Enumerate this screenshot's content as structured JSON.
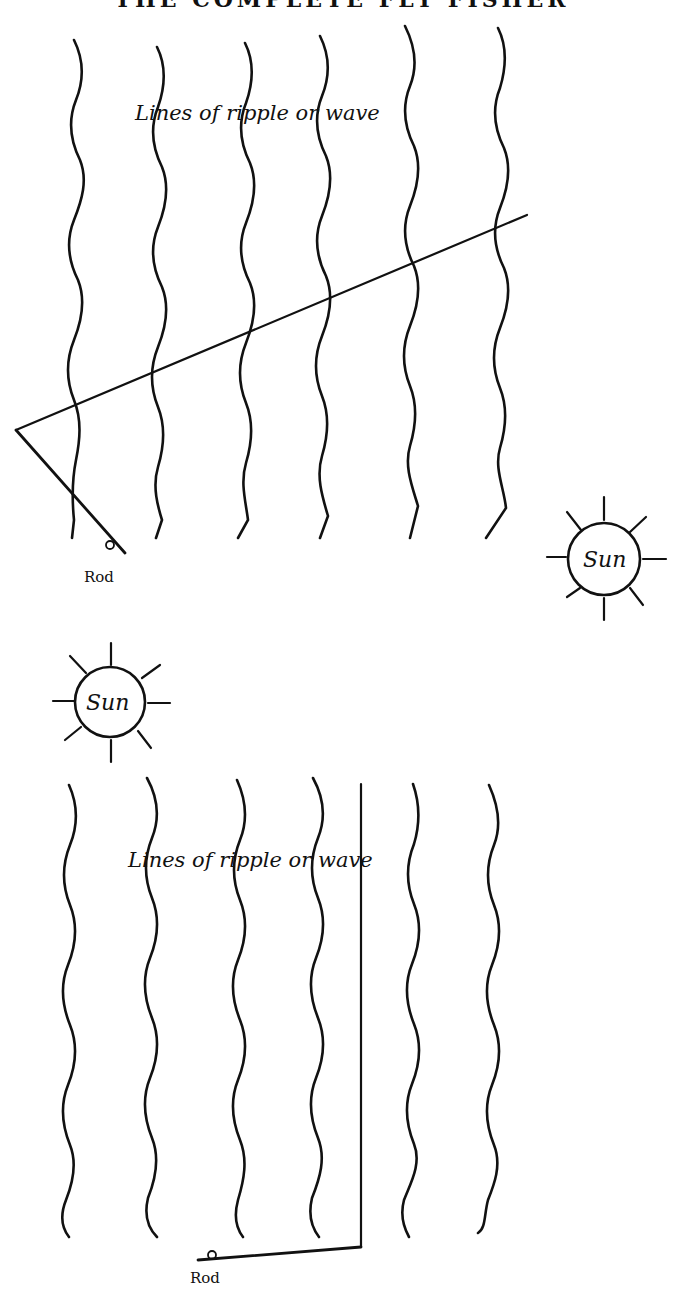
{
  "page": {
    "running_header": "THE COMPLETE FLY FISHER"
  },
  "diagrams": [
    {
      "id": "figure-top",
      "label_ripple": "Lines of ripple or wave",
      "sun_label": "Sun",
      "rod_label": "Rod",
      "sun_position": "right",
      "line_direction": "angled across ripples"
    },
    {
      "id": "figure-bottom",
      "label_ripple": "Lines of ripple or wave",
      "sun_label": "Sun",
      "rod_label": "Rod",
      "sun_position": "upper-left",
      "line_direction": "parallel to ripples"
    }
  ],
  "colors": {
    "ink": "#111111",
    "paper": "#ffffff"
  }
}
